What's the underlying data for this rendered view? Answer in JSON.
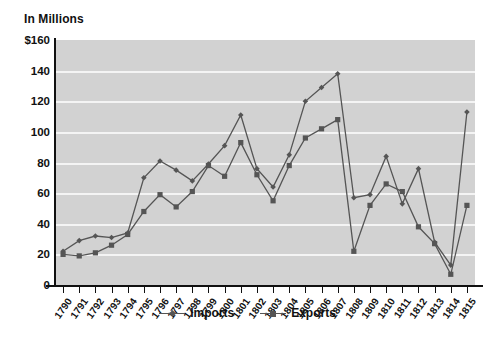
{
  "chart_data": {
    "type": "line",
    "title": "In Millions",
    "xlabel": "",
    "ylabel": "In Millions",
    "ylim": [
      0,
      160
    ],
    "yticks": [
      "$160",
      "140",
      "120",
      "100",
      "80",
      "60",
      "40",
      "20",
      "0"
    ],
    "ytick_values": [
      160,
      140,
      120,
      100,
      80,
      60,
      40,
      20,
      0
    ],
    "grid": true,
    "legend_position": "bottom",
    "categories": [
      "1790",
      "1791",
      "1792",
      "1793",
      "1794",
      "1795",
      "1796",
      "1797",
      "1798",
      "1799",
      "1800",
      "1801",
      "1802",
      "1803",
      "1804",
      "1805",
      "1806",
      "1807",
      "1808",
      "1809",
      "1810",
      "1811",
      "1812",
      "1813",
      "1814",
      "1815"
    ],
    "series": [
      {
        "name": "Imports",
        "marker": "diamond",
        "color": "#555555",
        "values": [
          22,
          29,
          32,
          31,
          34,
          70,
          81,
          75,
          68,
          79,
          91,
          111,
          76,
          64,
          85,
          120,
          129,
          138,
          57,
          59,
          84,
          53,
          76,
          28,
          13,
          113
        ]
      },
      {
        "name": "Exports",
        "marker": "square",
        "color": "#555555",
        "values": [
          20,
          19,
          21,
          26,
          33,
          48,
          59,
          51,
          61,
          78,
          71,
          93,
          72,
          55,
          78,
          96,
          102,
          108,
          22,
          52,
          66,
          61,
          38,
          27,
          7,
          52
        ]
      }
    ]
  },
  "legend": {
    "items": [
      {
        "label": "Imports"
      },
      {
        "label": "Exports"
      }
    ]
  }
}
